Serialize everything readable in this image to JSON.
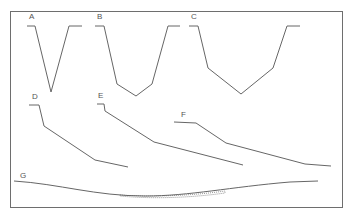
{
  "diagram": {
    "type": "channel cross-section profiles",
    "frame": {
      "x": 10,
      "y": 11,
      "width": 333,
      "height": 197
    },
    "line_color": "#666666",
    "profiles": [
      {
        "label": "A",
        "label_pos": [
          29,
          13
        ],
        "points": "27,26 35,26 51,92 69,26 82,26"
      },
      {
        "label": "B",
        "label_pos": [
          97,
          13
        ],
        "points": "95,26 104,26 117,84 136,96 152,84 168,26 180,26"
      },
      {
        "label": "C",
        "label_pos": [
          191,
          13
        ],
        "points": "189,26 198,26 208,68 241,94 273,68 287,26 300,26"
      },
      {
        "label": "D",
        "label_pos": [
          32,
          93
        ],
        "points": "29,105 39,105 44,126 95,160 128,167"
      },
      {
        "label": "E",
        "label_pos": [
          98,
          92
        ],
        "points": "97,104 104,104 105,111 154,142 243,165"
      },
      {
        "label": "F",
        "label_pos": [
          181,
          111
        ],
        "points": "174,122 196,123 226,143 305,164 331,166"
      },
      {
        "label": "G",
        "label_pos": [
          20,
          172
        ],
        "path": "M14,181 C60,184 95,196 145,196 C190,196 230,187 290,182 L318,181",
        "fill_path": "M120,195 C150,197 190,196 225,191 L225,193 C190,198 150,199 120,196 Z"
      }
    ]
  }
}
